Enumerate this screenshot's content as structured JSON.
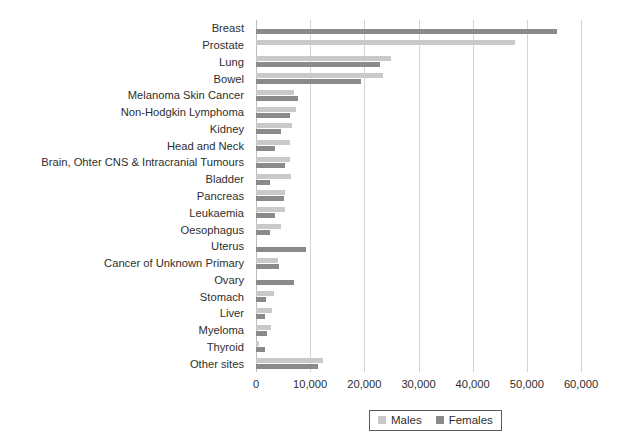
{
  "chart_data": {
    "type": "bar",
    "orientation": "horizontal",
    "title": "",
    "xlabel": "",
    "ylabel": "",
    "xlim": [
      0,
      60000
    ],
    "grid": true,
    "legend_position": "bottom",
    "xticks": [
      "0",
      "10,000",
      "20,000",
      "30,000",
      "40,000",
      "50,000",
      "60,000"
    ],
    "xtick_values": [
      0,
      10000,
      20000,
      30000,
      40000,
      50000,
      60000
    ],
    "categories": [
      "Breast",
      "Prostate",
      "Lung",
      "Bowel",
      "Melanoma Skin Cancer",
      "Non-Hodgkin Lymphoma",
      "Kidney",
      "Head and Neck",
      "Brain, Ohter CNS & Intracranial Tumours",
      "Bladder",
      "Pancreas",
      "Leukaemia",
      "Oesophagus",
      "Uterus",
      "Cancer of Unknown Primary",
      "Ovary",
      "Stomach",
      "Liver",
      "Myeloma",
      "Thyroid",
      "Other sites"
    ],
    "series": [
      {
        "name": "Males",
        "color": "#c9c9c9",
        "values": [
          0,
          47800,
          25000,
          23500,
          7100,
          7300,
          6700,
          6300,
          6200,
          6500,
          5400,
          5400,
          4700,
          0,
          4100,
          0,
          3300,
          3000,
          2700,
          600,
          12300
        ]
      },
      {
        "name": "Females",
        "color": "#8a8a8a",
        "values": [
          55500,
          0,
          22800,
          19400,
          7800,
          6200,
          4700,
          3500,
          5400,
          2500,
          5200,
          3500,
          2500,
          9200,
          4300,
          7000,
          1900,
          1700,
          2100,
          1700,
          11400
        ]
      }
    ]
  },
  "legend": {
    "items": [
      {
        "label": "Males",
        "swatch": "males-swatch"
      },
      {
        "label": "Females",
        "swatch": "females-swatch"
      }
    ]
  }
}
